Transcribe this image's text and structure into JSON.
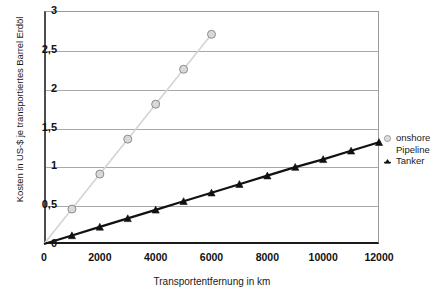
{
  "chart_data": {
    "type": "line",
    "title": "",
    "title_note": "title row is cropped off the top of the screenshot and is illegible",
    "xlabel": "Transportentfernung in km",
    "ylabel": "Kosten in US-$ je transportiertes Barrel Erdöl",
    "xlim": [
      0,
      12000
    ],
    "ylim": [
      0,
      3
    ],
    "grid": true,
    "legend_position": "right",
    "x_ticks": [
      "0",
      "2000",
      "4000",
      "6000",
      "8000",
      "10000",
      "12000"
    ],
    "x_tick_values": [
      0,
      2000,
      4000,
      6000,
      8000,
      10000,
      12000
    ],
    "y_ticks": [
      "0",
      "0,5",
      "1",
      "1,5",
      "2",
      "2,5",
      "3"
    ],
    "y_tick_values": [
      0,
      0.5,
      1,
      1.5,
      2,
      2.5,
      3
    ],
    "series": [
      {
        "name": "onshore Pipeline",
        "marker": "circle",
        "color": "#d4d4d4",
        "marker_fill": "#d9d9d9",
        "marker_stroke": "#8c8c8c",
        "x": [
          0,
          1000,
          2000,
          3000,
          4000,
          5000,
          6000
        ],
        "values": [
          0,
          0.45,
          0.9,
          1.35,
          1.8,
          2.25,
          2.7
        ]
      },
      {
        "name": "Tanker",
        "marker": "triangle",
        "color": "#111111",
        "marker_fill": "#111111",
        "marker_stroke": "#111111",
        "x": [
          0,
          1000,
          2000,
          3000,
          4000,
          5000,
          6000,
          7000,
          8000,
          9000,
          10000,
          11000,
          12000
        ],
        "values": [
          0,
          0.11,
          0.22,
          0.33,
          0.44,
          0.55,
          0.66,
          0.77,
          0.88,
          0.99,
          1.09,
          1.2,
          1.31
        ]
      }
    ]
  },
  "legend": {
    "entries": [
      {
        "label_line1": "onshore",
        "label_line2": "Pipeline"
      },
      {
        "label_line1": "Tanker",
        "label_line2": ""
      }
    ]
  }
}
